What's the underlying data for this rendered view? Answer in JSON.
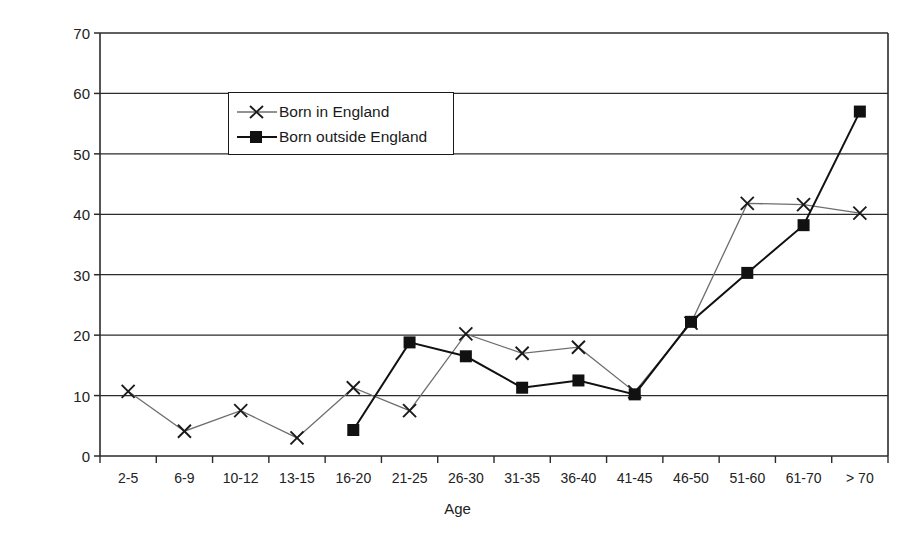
{
  "chart_data": {
    "type": "line",
    "title": "",
    "xlabel": "Age",
    "ylabel": "Absolute Percentage",
    "ylim": [
      0,
      70
    ],
    "ytick_step": 10,
    "yticks": [
      0,
      10,
      20,
      30,
      40,
      50,
      60,
      70
    ],
    "grid": true,
    "grid_axis": "y",
    "legend_position": "upper-left-inside",
    "categories": [
      "2-5",
      "6-9",
      "10-12",
      "13-15",
      "16-20",
      "21-25",
      "26-30",
      "31-35",
      "36-40",
      "41-45",
      "46-50",
      "51-60",
      "61-70",
      "> 70"
    ],
    "series": [
      {
        "name": "Born in England",
        "marker": "x",
        "color": "#6e6e6e",
        "values": [
          10.7,
          4.1,
          7.5,
          3.0,
          11.3,
          7.5,
          20.2,
          17.0,
          18.0,
          10.6,
          22.0,
          41.8,
          41.6,
          40.2
        ]
      },
      {
        "name": "Born outside England",
        "marker": "square",
        "color": "#111111",
        "values": [
          null,
          null,
          null,
          null,
          4.3,
          18.8,
          16.5,
          11.3,
          12.5,
          10.2,
          22.2,
          30.3,
          38.2,
          57.0
        ]
      }
    ]
  },
  "axes": {
    "y_title": "Absolute Percentage",
    "x_title": "Age",
    "y_tick_labels": [
      "70",
      "60",
      "50",
      "40",
      "30",
      "20",
      "10",
      "0"
    ],
    "x_tick_labels": [
      "2-5",
      "6-9",
      "10-12",
      "13-15",
      "16-20",
      "21-25",
      "26-30",
      "31-35",
      "36-40",
      "41-45",
      "46-50",
      "51-60",
      "61-70",
      "> 70"
    ]
  },
  "legend": {
    "entries": [
      {
        "label": "Born in England",
        "marker": "x-marker",
        "color": "#6e6e6e"
      },
      {
        "label": "Born outside England",
        "marker": "square-marker",
        "color": "#111111"
      }
    ]
  },
  "colors": {
    "frame": "#2b2b2b",
    "grid": "#2b2b2b",
    "background": "#ffffff",
    "series_england": "#6e6e6e",
    "series_outside": "#111111"
  }
}
